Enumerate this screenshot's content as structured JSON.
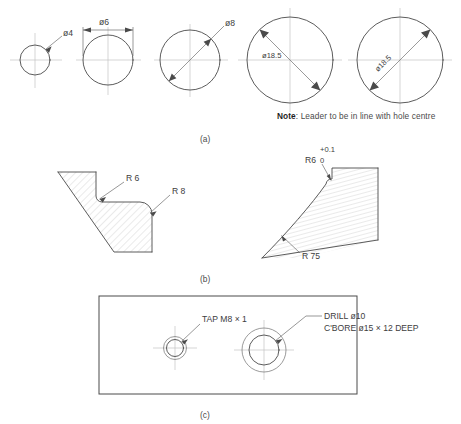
{
  "figure": {
    "captions": {
      "a": "(a)",
      "b": "(b)",
      "c": "(c)"
    },
    "note": {
      "keyword": "Note",
      "separator": ": ",
      "text": "Leader to be in line with hole centre"
    }
  },
  "row_a": {
    "holes": [
      {
        "id": "hole-dia-4",
        "label": "ø4",
        "value": 4,
        "diameter_px": 30,
        "centre_x": 35,
        "centre_y": 60,
        "dim_style": "leader-outside"
      },
      {
        "id": "hole-dia-6",
        "label": "ø6",
        "value": 6,
        "diameter_px": 50,
        "centre_x": 108,
        "centre_y": 60,
        "dim_style": "linear-above"
      },
      {
        "id": "hole-dia-8",
        "label": "ø8",
        "value": 8,
        "diameter_px": 60,
        "centre_x": 190,
        "centre_y": 60,
        "dim_style": "diagonal-leader-outside"
      },
      {
        "id": "hole-dia-18-5-inside-horizontal",
        "label": "ø18.5",
        "value": 18.5,
        "diameter_px": 86,
        "centre_x": 290,
        "centre_y": 60,
        "dim_style": "diagonal-text-horizontal"
      },
      {
        "id": "hole-dia-18-5-inside-aligned",
        "label": "ø18.5",
        "value": 18.5,
        "diameter_px": 86,
        "centre_x": 400,
        "centre_y": 60,
        "dim_style": "diagonal-text-aligned"
      }
    ]
  },
  "row_b": {
    "left_view": {
      "id": "fillet-and-round-section",
      "radii": [
        {
          "id": "radius-r6",
          "label": "R 6",
          "value": 6,
          "kind": "internal-fillet"
        },
        {
          "id": "radius-r8",
          "label": "R 8",
          "value": 8,
          "kind": "external-round"
        }
      ]
    },
    "right_view": {
      "id": "large-radius-section",
      "radii": [
        {
          "id": "radius-r6-toleranced",
          "label": "R6",
          "value": 6,
          "tolerance_upper": "+0.1",
          "tolerance_lower": "0",
          "kind": "internal-fillet"
        },
        {
          "id": "radius-r75",
          "label": "R 75",
          "value": 75,
          "kind": "large-arc"
        }
      ]
    }
  },
  "row_c": {
    "plate": {
      "id": "plate-view",
      "features": [
        {
          "id": "tapped-hole",
          "lines": [
            "TAP M8 × 1"
          ],
          "centre_x": 175,
          "centre_y": 348
        },
        {
          "id": "counterbored-hole",
          "lines": [
            "DRILL ø10",
            "C'BORE ø15 × 12 DEEP"
          ],
          "centre_x": 264,
          "centre_y": 350
        }
      ]
    }
  }
}
